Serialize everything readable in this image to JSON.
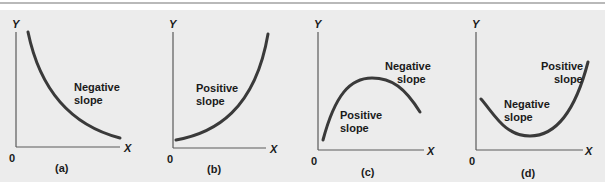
{
  "figure": {
    "background_color": "#ececec",
    "curve_color": "#3a3a3a",
    "panels": [
      {
        "id": "a",
        "caption": "(a)",
        "y_axis_label": "Y",
        "x_axis_label": "X",
        "origin_label": "0",
        "labels": [
          {
            "line1": "Negative",
            "line2": "slope"
          }
        ]
      },
      {
        "id": "b",
        "caption": "(b)",
        "y_axis_label": "Y",
        "x_axis_label": "X",
        "origin_label": "0",
        "labels": [
          {
            "line1": "Positive",
            "line2": "slope"
          }
        ]
      },
      {
        "id": "c",
        "caption": "(c)",
        "y_axis_label": "Y",
        "x_axis_label": "X",
        "origin_label": "0",
        "labels": [
          {
            "line1": "Negative",
            "line2": "slope"
          },
          {
            "line1": "Positive",
            "line2": "slope"
          }
        ]
      },
      {
        "id": "d",
        "caption": "(d)",
        "y_axis_label": "Y",
        "x_axis_label": "X",
        "origin_label": "0",
        "labels": [
          {
            "line1": "Positive",
            "line2": "slope"
          },
          {
            "line1": "Negative",
            "line2": "slope"
          }
        ]
      }
    ]
  }
}
